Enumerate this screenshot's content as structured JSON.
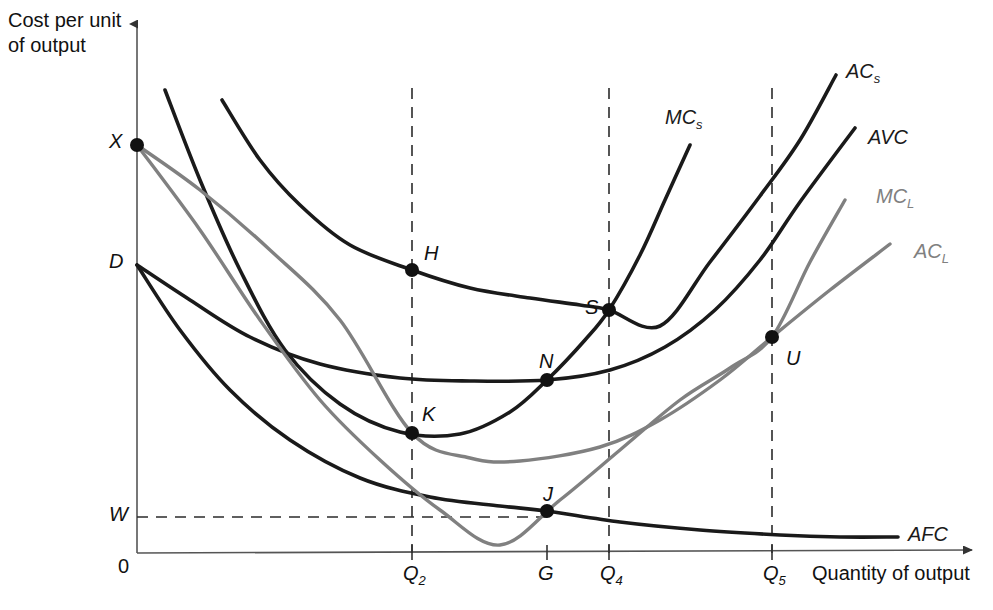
{
  "figure": {
    "type": "economics-cost-curve-diagram",
    "y_axis_title": "Cost per unit\nof output",
    "x_axis_title": "Quantity of output",
    "origin_label": "0",
    "axis_color": "#555555",
    "curve_color_short_run": "#1a1a1a",
    "curve_color_long_run": "#808080",
    "background": "#ffffff"
  },
  "y_axis_marks": [
    {
      "id": "X",
      "label": "X",
      "y": 145,
      "has_dot": true
    },
    {
      "id": "D",
      "label": "D",
      "y": 265,
      "has_dot": false
    },
    {
      "id": "W",
      "label": "W",
      "y": 517,
      "has_dot": false
    }
  ],
  "x_axis_ticks": [
    {
      "id": "Q2",
      "label": "Q",
      "sub": "2",
      "x": 412
    },
    {
      "id": "G",
      "label": "G",
      "sub": "",
      "x": 547
    },
    {
      "id": "Q4",
      "label": "Q",
      "sub": "4",
      "x": 609
    },
    {
      "id": "Q5",
      "label": "Q",
      "sub": "5",
      "x": 772
    }
  ],
  "curve_labels": [
    {
      "id": "ACs",
      "label": "AC",
      "sub": "s",
      "x": 846,
      "y": 60,
      "color": "#1a1a1a"
    },
    {
      "id": "AVC",
      "label": "AVC",
      "sub": "",
      "x": 868,
      "y": 126,
      "color": "#1a1a1a"
    },
    {
      "id": "MCL",
      "label": "MC",
      "sub": "L",
      "x": 876,
      "y": 185,
      "color": "#808080"
    },
    {
      "id": "ACL",
      "label": "AC",
      "sub": "L",
      "x": 914,
      "y": 240,
      "color": "#808080"
    },
    {
      "id": "MCs",
      "label": "MC",
      "sub": "s",
      "x": 665,
      "y": 106,
      "color": "#1a1a1a"
    },
    {
      "id": "AFC",
      "label": "AFC",
      "sub": "",
      "x": 908,
      "y": 523,
      "color": "#1a1a1a"
    }
  ],
  "points": [
    {
      "id": "X",
      "label": "X",
      "x": 137,
      "y": 145,
      "label_dx": -26,
      "label_dy": -12,
      "on": "origin of AC_L and MC_L"
    },
    {
      "id": "H",
      "label": "H",
      "x": 412,
      "y": 270,
      "label_dx": 12,
      "label_dy": -28,
      "on": "AC_s at Q2"
    },
    {
      "id": "K",
      "label": "K",
      "x": 412,
      "y": 433,
      "label_dx": 10,
      "label_dy": -30,
      "on": "AVC and AC_L at Q2"
    },
    {
      "id": "S",
      "label": "S",
      "x": 609,
      "y": 310,
      "label_dx": -24,
      "label_dy": -14,
      "on": "AC_s and MC_s at Q4"
    },
    {
      "id": "N",
      "label": "N",
      "x": 547,
      "y": 380,
      "label_dx": -8,
      "label_dy": -30,
      "on": "AVC minimum at G"
    },
    {
      "id": "U",
      "label": "U",
      "x": 772,
      "y": 337,
      "label_dx": 14,
      "label_dy": 10,
      "on": "AC_L minimum and MC_L at Q5"
    },
    {
      "id": "J",
      "label": "J",
      "x": 547,
      "y": 511,
      "label_dx": -4,
      "label_dy": -28,
      "on": "AFC at G, level W"
    }
  ],
  "dashed_lines": [
    {
      "id": "Q2-vertical",
      "x1": 412,
      "y1": 88,
      "x2": 412,
      "y2": 553
    },
    {
      "id": "Q4-vertical",
      "x1": 609,
      "y1": 88,
      "x2": 609,
      "y2": 553
    },
    {
      "id": "Q5-vertical",
      "x1": 772,
      "y1": 88,
      "x2": 772,
      "y2": 553
    },
    {
      "id": "W-horizontal",
      "x1": 137,
      "y1": 517,
      "x2": 547,
      "y2": 517
    }
  ],
  "chart_data": {
    "type": "line",
    "title": "",
    "xlabel": "Quantity of output",
    "ylabel": "Cost per unit of output",
    "grid": false,
    "legend": "inline curve end labels",
    "series": [
      {
        "name": "AC_s",
        "description": "Short-run average total cost, U-shaped, starts high left",
        "color": "#1a1a1a",
        "path_points": [
          [
            222,
            100
          ],
          [
            260,
            160
          ],
          [
            300,
            205
          ],
          [
            350,
            245
          ],
          [
            412,
            270
          ],
          [
            470,
            288
          ],
          [
            530,
            298
          ],
          [
            580,
            305
          ],
          [
            609,
            310
          ],
          [
            660,
            326
          ],
          [
            710,
            262
          ],
          [
            760,
            196
          ],
          [
            800,
            140
          ],
          [
            836,
            75
          ]
        ]
      },
      {
        "name": "AVC",
        "description": "Short-run average variable cost, from D, minimum N at G",
        "color": "#1a1a1a",
        "path_points": [
          [
            137,
            265
          ],
          [
            190,
            300
          ],
          [
            250,
            337
          ],
          [
            320,
            364
          ],
          [
            400,
            378
          ],
          [
            470,
            381
          ],
          [
            547,
            380
          ],
          [
            610,
            370
          ],
          [
            665,
            347
          ],
          [
            715,
            310
          ],
          [
            760,
            260
          ],
          [
            800,
            202
          ],
          [
            855,
            128
          ]
        ]
      },
      {
        "name": "MC_s",
        "description": "Short-run marginal cost, steep decline then steep rise, cuts AVC at N and AC_s at S",
        "color": "#1a1a1a",
        "path_points": [
          [
            165,
            90
          ],
          [
            200,
            180
          ],
          [
            240,
            270
          ],
          [
            285,
            350
          ],
          [
            340,
            404
          ],
          [
            400,
            432
          ],
          [
            460,
            434
          ],
          [
            510,
            412
          ],
          [
            547,
            380
          ],
          [
            585,
            340
          ],
          [
            609,
            310
          ],
          [
            640,
            255
          ],
          [
            665,
            200
          ],
          [
            690,
            145
          ]
        ]
      },
      {
        "name": "AFC",
        "description": "Average fixed cost, rectangular hyperbola from D through J",
        "color": "#1a1a1a",
        "path_points": [
          [
            137,
            265
          ],
          [
            180,
            330
          ],
          [
            230,
            390
          ],
          [
            290,
            440
          ],
          [
            360,
            478
          ],
          [
            430,
            497
          ],
          [
            500,
            506
          ],
          [
            547,
            511
          ],
          [
            620,
            522
          ],
          [
            700,
            530
          ],
          [
            780,
            535
          ],
          [
            840,
            537
          ],
          [
            898,
            537
          ]
        ]
      },
      {
        "name": "AC_L",
        "description": "Long-run average cost envelope from X, minimum U at Q5",
        "color": "#808080",
        "path_points": [
          [
            137,
            145
          ],
          [
            200,
            190
          ],
          [
            270,
            250
          ],
          [
            340,
            320
          ],
          [
            412,
            433
          ],
          [
            470,
            458
          ],
          [
            520,
            461
          ],
          [
            600,
            447
          ],
          [
            660,
            420
          ],
          [
            720,
            380
          ],
          [
            772,
            337
          ],
          [
            830,
            290
          ],
          [
            890,
            244
          ]
        ]
      },
      {
        "name": "MC_L",
        "description": "Long-run marginal cost from X, cuts AC_L at its minimum U",
        "color": "#808080",
        "path_points": [
          [
            137,
            145
          ],
          [
            200,
            230
          ],
          [
            260,
            320
          ],
          [
            320,
            400
          ],
          [
            380,
            460
          ],
          [
            440,
            510
          ],
          [
            500,
            545
          ],
          [
            560,
            500
          ],
          [
            620,
            450
          ],
          [
            680,
            400
          ],
          [
            730,
            368
          ],
          [
            772,
            337
          ],
          [
            810,
            262
          ],
          [
            845,
            200
          ]
        ]
      }
    ]
  }
}
